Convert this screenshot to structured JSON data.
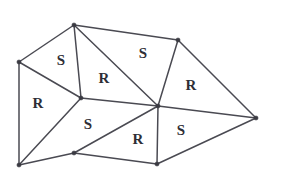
{
  "figure": {
    "name": "triangular-mesh-diagram",
    "background_color": "#ffffff",
    "edge_color": "#4a4a52",
    "vertex_color": "#3a3a42",
    "label_color": "#2e2e36",
    "width": 284,
    "height": 183
  },
  "vertices": [
    {
      "id": "v-left",
      "name": "vertex-left",
      "x": 19,
      "y": 62
    },
    {
      "id": "v-top",
      "name": "vertex-top",
      "x": 74,
      "y": 25
    },
    {
      "id": "v-top-right",
      "name": "vertex-top-right",
      "x": 178,
      "y": 40
    },
    {
      "id": "v-mid-left",
      "name": "vertex-mid-left",
      "x": 81,
      "y": 98
    },
    {
      "id": "v-hub",
      "name": "vertex-center-hub",
      "x": 158,
      "y": 106
    },
    {
      "id": "v-right",
      "name": "vertex-right",
      "x": 256,
      "y": 118
    },
    {
      "id": "v-bottom-left",
      "name": "vertex-bottom-left",
      "x": 19,
      "y": 165
    },
    {
      "id": "v-bottom-mid",
      "name": "vertex-bottom-middle",
      "x": 74,
      "y": 153
    },
    {
      "id": "v-bottom",
      "name": "vertex-bottom",
      "x": 157,
      "y": 164
    }
  ],
  "edges": [
    {
      "name": "edge-left-to-top",
      "from": "v-left",
      "to": "v-top"
    },
    {
      "name": "edge-top-to-top-right",
      "from": "v-top",
      "to": "v-top-right"
    },
    {
      "name": "edge-top-right-to-right",
      "from": "v-top-right",
      "to": "v-right"
    },
    {
      "name": "edge-right-to-bottom",
      "from": "v-right",
      "to": "v-bottom"
    },
    {
      "name": "edge-bottom-to-bottom-middle",
      "from": "v-bottom",
      "to": "v-bottom-mid"
    },
    {
      "name": "edge-bottom-middle-to-bottom-left",
      "from": "v-bottom-mid",
      "to": "v-bottom-left"
    },
    {
      "name": "edge-bottom-left-to-left",
      "from": "v-bottom-left",
      "to": "v-left"
    },
    {
      "name": "edge-left-to-mid-left",
      "from": "v-left",
      "to": "v-mid-left"
    },
    {
      "name": "edge-top-to-mid-left",
      "from": "v-top",
      "to": "v-mid-left"
    },
    {
      "name": "edge-top-to-hub",
      "from": "v-top",
      "to": "v-hub"
    },
    {
      "name": "edge-top-right-to-hub",
      "from": "v-top-right",
      "to": "v-hub"
    },
    {
      "name": "edge-mid-left-to-hub",
      "from": "v-mid-left",
      "to": "v-hub"
    },
    {
      "name": "edge-hub-to-right",
      "from": "v-hub",
      "to": "v-right"
    },
    {
      "name": "edge-hub-to-bottom",
      "from": "v-hub",
      "to": "v-bottom"
    },
    {
      "name": "edge-hub-to-bottom-middle",
      "from": "v-hub",
      "to": "v-bottom-mid"
    },
    {
      "name": "edge-mid-left-to-bottom-left",
      "from": "v-mid-left",
      "to": "v-bottom-left"
    }
  ],
  "labels": [
    {
      "name": "face-label-s-upper-left",
      "text": "S",
      "x": 61,
      "y": 60
    },
    {
      "name": "face-label-r-upper-mid",
      "text": "R",
      "x": 104,
      "y": 78
    },
    {
      "name": "face-label-s-upper-right",
      "text": "S",
      "x": 143,
      "y": 53
    },
    {
      "name": "face-label-r-right",
      "text": "R",
      "x": 191,
      "y": 85
    },
    {
      "name": "face-label-r-left",
      "text": "R",
      "x": 38,
      "y": 103
    },
    {
      "name": "face-label-s-lower-left",
      "text": "S",
      "x": 88,
      "y": 124
    },
    {
      "name": "face-label-r-lower-mid",
      "text": "R",
      "x": 138,
      "y": 139
    },
    {
      "name": "face-label-s-lower-right",
      "text": "S",
      "x": 181,
      "y": 130
    }
  ]
}
